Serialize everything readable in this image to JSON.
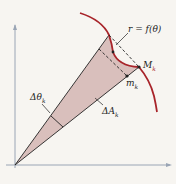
{
  "labels": {
    "curve": "r = f(θ)",
    "M": "M",
    "M_sub": "k",
    "m": "m",
    "m_sub": "k",
    "dtheta": "Δθ",
    "dtheta_sub": "k",
    "dA": "ΔA",
    "dA_sub": "k"
  },
  "colors": {
    "curve": "#a8242a",
    "fill": "#d9bfbc",
    "line": "#222222",
    "axis": "#9aa5b5"
  }
}
